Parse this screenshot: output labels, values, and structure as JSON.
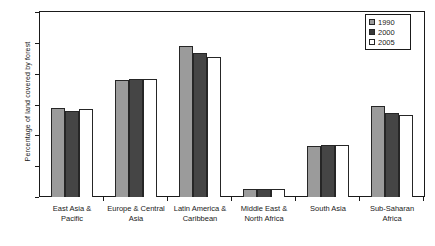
{
  "chart_data": {
    "type": "bar",
    "title": "",
    "subtitle": "",
    "xlabel": "",
    "ylabel": "Percentage of land covered by forest",
    "ylim": [
      0,
      60
    ],
    "yticks": [
      0,
      10,
      20,
      30,
      40,
      50,
      60
    ],
    "ytick_labels": [
      "0",
      "10",
      "20",
      "30",
      "40",
      "50",
      "60"
    ],
    "grid": false,
    "legend_position": "top-right",
    "categories": [
      "East Asia & Pacific",
      "Europe & Central Asia",
      "Latin America & Caribbean",
      "Middle East & North Africa",
      "South Asia",
      "Sub-Saharan Africa"
    ],
    "series": [
      {
        "name": "1990",
        "color": "#9b9b9b",
        "values": [
          28.8,
          38.1,
          49.0,
          2.7,
          16.6,
          29.4
        ]
      },
      {
        "name": "2000",
        "color": "#454545",
        "values": [
          28.0,
          38.3,
          46.6,
          2.6,
          16.8,
          27.3
        ]
      },
      {
        "name": "2005",
        "color": "#ffffff",
        "values": [
          28.4,
          38.3,
          45.4,
          2.6,
          16.9,
          26.5
        ]
      }
    ]
  },
  "legend": {
    "items": [
      {
        "label": "1990",
        "swatch": "series-1990-swatch"
      },
      {
        "label": "2000",
        "swatch": "series-2000-swatch"
      },
      {
        "label": "2005",
        "swatch": "series-2005-swatch"
      }
    ]
  },
  "axes": {
    "y_title": "Percentage of land covered by forest"
  }
}
